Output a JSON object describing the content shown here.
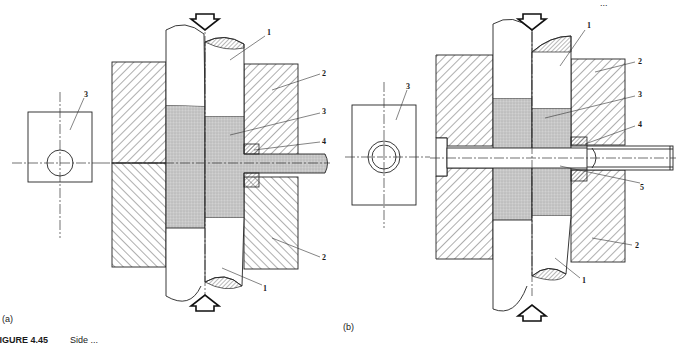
{
  "figure": {
    "caption_number": "FIGURE 4.45",
    "caption_text": "Side ...",
    "header_fragment": "...",
    "colors": {
      "ink": "#222222",
      "material_fill": "#c8c8c8",
      "background": "#ffffff"
    }
  },
  "panel_a": {
    "sublabel": "(a)",
    "callouts": {
      "punch_top": "1",
      "die_top": "2",
      "billet": "3",
      "insert": "4",
      "die_bottom": "2",
      "punch_bottom": "1",
      "plan_view": "3"
    }
  },
  "panel_b": {
    "sublabel": "(b)",
    "callouts": {
      "punch_top": "1",
      "die_top": "2",
      "billet": "3",
      "insert": "4",
      "mandrel": "5",
      "die_bottom": "2",
      "punch_bottom": "1",
      "plan_view": "3"
    }
  }
}
